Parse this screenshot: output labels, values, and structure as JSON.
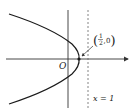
{
  "diagram": {
    "type": "parabola-graph",
    "curve": "parabola opening left",
    "origin_label": "O",
    "point_label": {
      "numerator": "1",
      "denominator": "2",
      "y": "0"
    },
    "dashed_line_label": "x = 1",
    "colors": {
      "curve": "#1a1a1a",
      "axes": "#333333",
      "dashed": "#666666",
      "text": "#222222"
    }
  }
}
